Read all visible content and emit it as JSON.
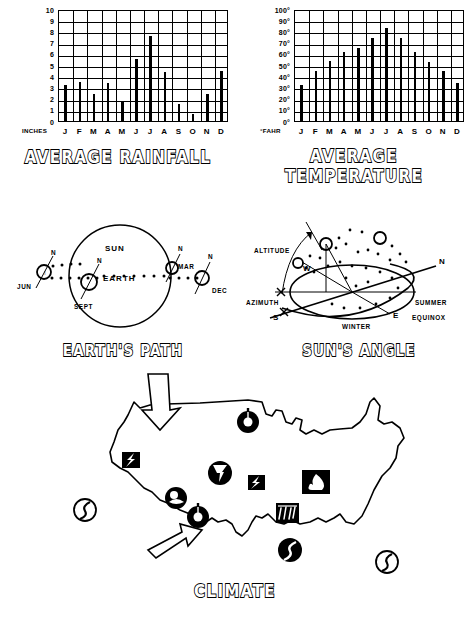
{
  "page": {
    "background": "#ffffff",
    "ink": "#000000"
  },
  "charts": [
    {
      "id": "rainfall",
      "title": "AVERAGE RAINFALL",
      "axis_caption": "INCHES",
      "y_ticks": [
        "10",
        "9",
        "8",
        "7",
        "6",
        "5",
        "4",
        "3",
        "2",
        "1",
        "0"
      ]
    },
    {
      "id": "temperature",
      "title": "AVERAGE TEMPERATURE",
      "axis_caption": "°FAHR",
      "y_ticks": [
        "100°",
        "90°",
        "80°",
        "70°",
        "60°",
        "50°",
        "40°",
        "30°",
        "20°",
        "10°",
        "0°"
      ]
    }
  ],
  "chart_data": [
    {
      "type": "bar",
      "title": "AVERAGE RAINFALL",
      "xlabel": "INCHES",
      "ylabel": "INCHES",
      "categories": [
        "J",
        "F",
        "M",
        "A",
        "M",
        "J",
        "J",
        "A",
        "S",
        "O",
        "N",
        "D"
      ],
      "values": [
        3.2,
        3.5,
        2.4,
        3.4,
        1.7,
        5.5,
        7.6,
        4.4,
        1.5,
        0.6,
        2.4,
        4.5
      ],
      "ylim": [
        0,
        10
      ],
      "ytick_step": 1,
      "grid": true,
      "legend": "none"
    },
    {
      "type": "bar",
      "title": "AVERAGE TEMPERATURE",
      "xlabel": "°FAHR",
      "ylabel": "Degrees Fahrenheit",
      "categories": [
        "J",
        "F",
        "M",
        "A",
        "M",
        "J",
        "J",
        "A",
        "S",
        "O",
        "N",
        "D"
      ],
      "values": [
        32,
        45,
        54,
        62,
        65,
        74,
        83,
        74,
        62,
        53,
        45,
        34
      ],
      "ylim": [
        0,
        100
      ],
      "ytick_step": 10,
      "grid": true,
      "legend": "none"
    }
  ],
  "diagrams": {
    "earth_path": {
      "title": "EARTH'S PATH",
      "sun_label": "SUN",
      "earth_label": "EARTH",
      "month_labels": [
        "JUN",
        "MAR",
        "SEPT",
        "DEC"
      ],
      "pole_labels": [
        "N",
        "N",
        "N",
        "N"
      ]
    },
    "suns_angle": {
      "title": "SUN'S ANGLE",
      "altitude_label": "ALTITUDE",
      "azimuth_label": "AZIMUTH",
      "compass": [
        "N",
        "S",
        "E",
        "W"
      ],
      "path_labels": [
        "SUMMER",
        "EQUINOX",
        "WINTER"
      ]
    }
  },
  "map": {
    "title": "CLIMATE",
    "region": "United States",
    "symbols": [
      {
        "name": "thermometer-icon",
        "label": "thermometer"
      },
      {
        "name": "lightning-icon",
        "label": "lightning"
      },
      {
        "name": "tornado-icon",
        "label": "tornado"
      },
      {
        "name": "sun-cloud-icon",
        "label": "sun behind cloud"
      },
      {
        "name": "lightning-icon",
        "label": "lightning"
      },
      {
        "name": "fire-icon",
        "label": "fire"
      },
      {
        "name": "rain-icon",
        "label": "rain"
      },
      {
        "name": "thermometer-icon",
        "label": "thermometer"
      },
      {
        "name": "hurricane-icon",
        "label": "hurricane"
      },
      {
        "name": "hurricane-icon",
        "label": "hurricane"
      },
      {
        "name": "hurricane-icon",
        "label": "hurricane"
      }
    ],
    "arrows": [
      {
        "name": "arrow-down-right",
        "label": "cold air inflow"
      },
      {
        "name": "arrow-up-right",
        "label": "warm air inflow"
      }
    ]
  }
}
